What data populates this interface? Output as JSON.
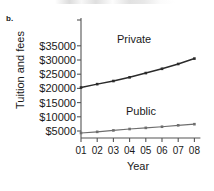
{
  "figure": {
    "panel_label": "b.",
    "ylabel": "Tuition and fees",
    "xlabel": "Year"
  },
  "axis": {
    "y_ticks": [
      "$35000",
      "$30000",
      "$25000",
      "$20000",
      "$15000",
      "$10000",
      "$5000"
    ],
    "x_ticks": [
      "01",
      "02",
      "03",
      "04",
      "05",
      "06",
      "07",
      "08"
    ]
  },
  "series_labels": {
    "private": "Private",
    "public": "Public"
  },
  "colors": {
    "private_line": "#2b2b2b",
    "public_line": "#6e6e6e",
    "axis": "#555555",
    "text": "#1a1a1a",
    "background": "#ffffff"
  },
  "chart_data": {
    "type": "line",
    "title": "",
    "xlabel": "Year",
    "ylabel": "Tuition and fees",
    "x": [
      "01",
      "02",
      "03",
      "04",
      "05",
      "06",
      "07",
      "08"
    ],
    "xlim": [
      "01",
      "08"
    ],
    "ylim": [
      0,
      35000
    ],
    "y_ticks": [
      5000,
      10000,
      15000,
      20000,
      25000,
      30000,
      35000
    ],
    "y_tick_labels": [
      "$5000",
      "$10000",
      "$15000",
      "$20000",
      "$25000",
      "$30000",
      "$35000"
    ],
    "grid": false,
    "legend": "inline-annotations",
    "series": [
      {
        "name": "Private",
        "color": "#2b2b2b",
        "values": [
          20300,
          21500,
          22600,
          23900,
          25400,
          26900,
          28600,
          30500
        ]
      },
      {
        "name": "Public",
        "color": "#6e6e6e",
        "values": [
          4300,
          4700,
          5200,
          5700,
          6100,
          6500,
          7000,
          7400
        ]
      }
    ]
  }
}
